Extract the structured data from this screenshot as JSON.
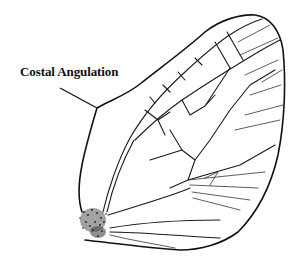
{
  "figure": {
    "annotations": [
      {
        "label": "Costal Angulation",
        "points_to": "costal margin angle near wing base"
      }
    ],
    "colors": {
      "ink": "#111111",
      "background": "#ffffff"
    }
  }
}
